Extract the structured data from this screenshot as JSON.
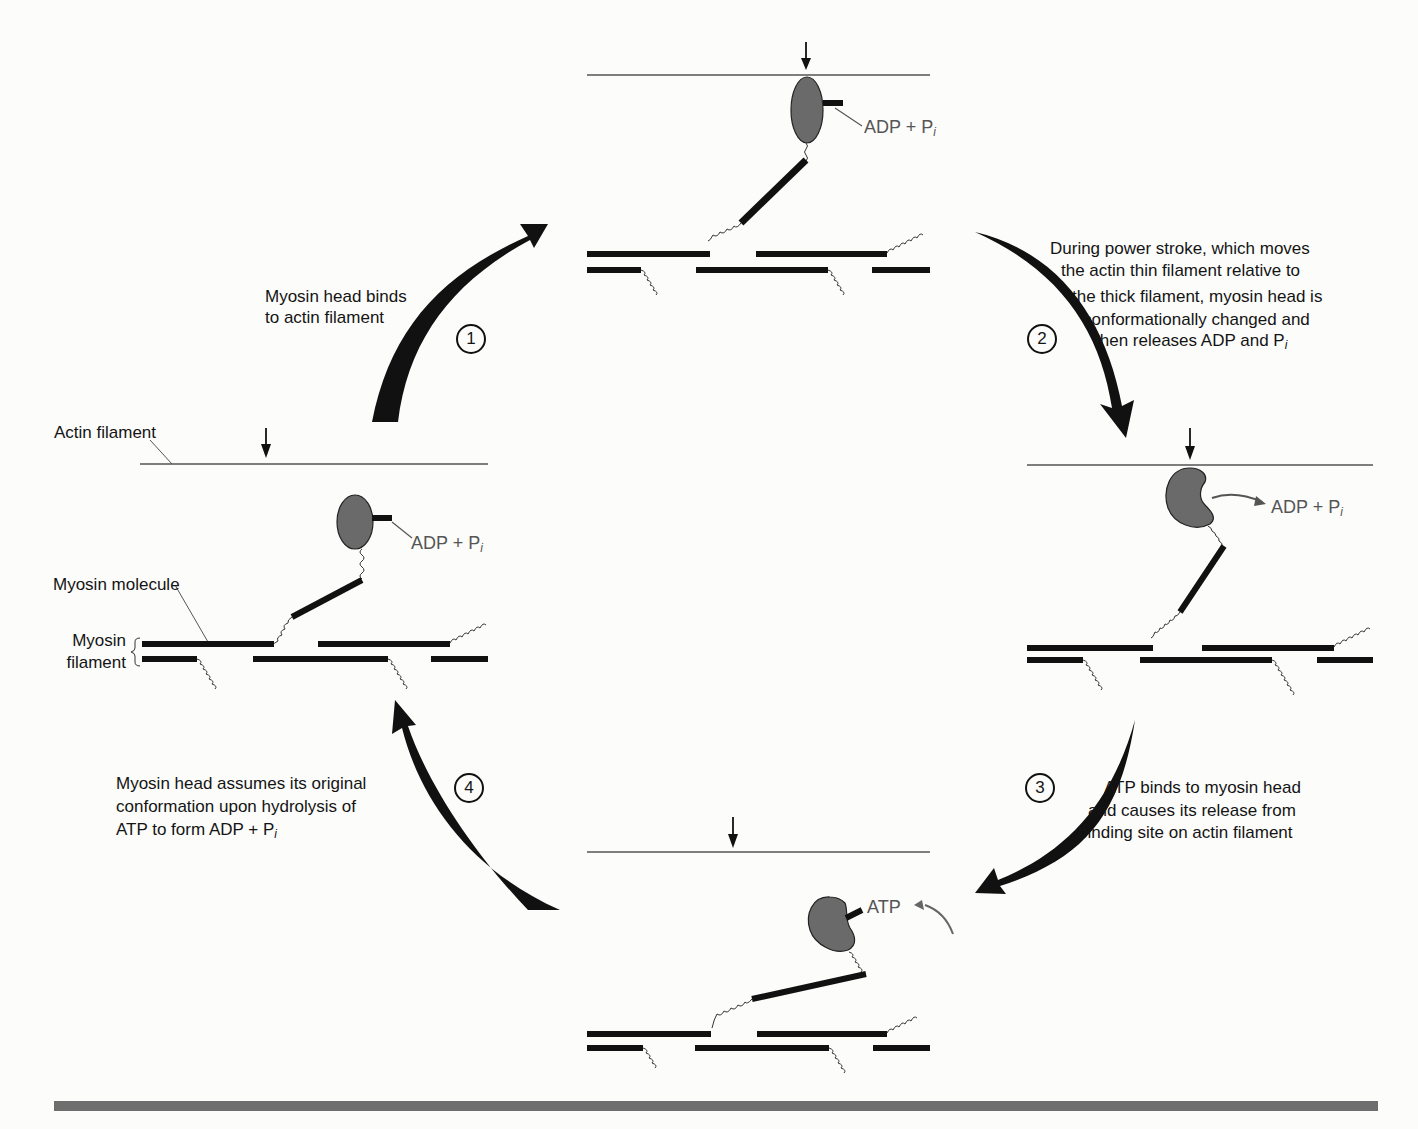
{
  "figure": {
    "colors": {
      "ink": "#111111",
      "myosin_head": "#6a6a6a",
      "label_gray": "#555555",
      "rule": "#6e6e6e"
    }
  },
  "labels": {
    "actin_filament": "Actin filament",
    "myosin_molecule": "Myosin molecule",
    "myosin_filament_line1": "Myosin",
    "myosin_filament_line2": "filament"
  },
  "states": {
    "top": {
      "ligand": "ADP + P",
      "ligand_sub": "i"
    },
    "right": {
      "ligand": "ADP + P",
      "ligand_sub": "i"
    },
    "bottom": {
      "ligand": "ATP"
    },
    "left": {
      "ligand": "ADP + P",
      "ligand_sub": "i"
    }
  },
  "steps": [
    {
      "number": "1",
      "lines": [
        "Myosin head binds",
        "to actin filament"
      ]
    },
    {
      "number": "2",
      "lines": [
        "During power stroke, which moves",
        "the actin thin filament relative to",
        "the thick filament, myosin head is",
        "conformationally changed and",
        "then releases ADP and P"
      ],
      "last_sub": "i"
    },
    {
      "number": "3",
      "lines": [
        "ATP binds to myosin head",
        "and causes its release from",
        "binding site on actin filament"
      ]
    },
    {
      "number": "4",
      "lines": [
        "Myosin head assumes its original",
        "conformation upon hydrolysis of",
        "ATP to form ADP + P"
      ],
      "last_sub": "i"
    }
  ]
}
